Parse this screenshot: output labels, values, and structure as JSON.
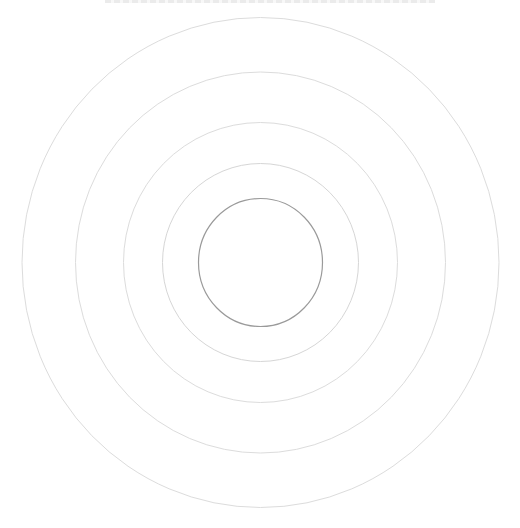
{
  "diagram": {
    "type": "concentric-rings",
    "center": {
      "cx": 260.5,
      "cy": 262.5
    },
    "rings": [
      {
        "rx": 238.5,
        "ry": 245,
        "stroke": "#dcdcdc",
        "width": 1
      },
      {
        "rx": 185,
        "ry": 190.5,
        "stroke": "#dcdcdc",
        "width": 1
      },
      {
        "rx": 137,
        "ry": 140,
        "stroke": "#dcdcdc",
        "width": 1
      },
      {
        "rx": 98,
        "ry": 99,
        "stroke": "#d6d6d6",
        "width": 1
      },
      {
        "rx": 62,
        "ry": 64,
        "stroke": "#9a9a9a",
        "width": 1.2
      }
    ]
  }
}
